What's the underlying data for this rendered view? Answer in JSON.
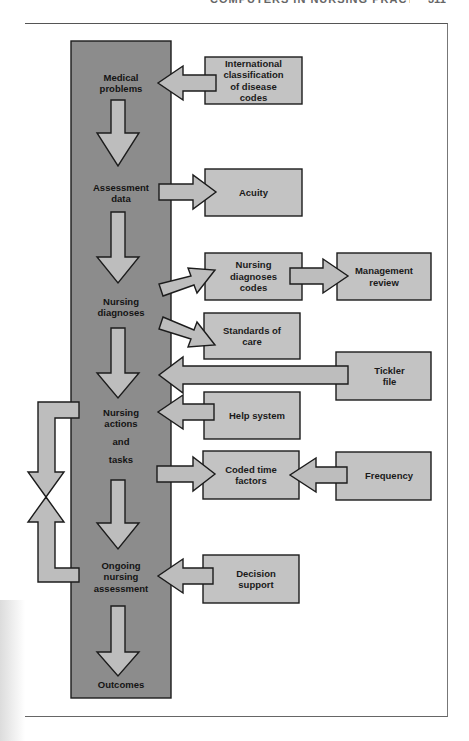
{
  "page": {
    "running_head": "COMPUTERS IN NURSING PRACTICE",
    "page_number": "311"
  },
  "colors": {
    "main_column": "#8c8c8c",
    "box_fill": "#c3c3c3",
    "arrow_fill": "#bdbdbd",
    "outline": "#1c1c1c",
    "background": "#ffffff"
  },
  "main_column": {
    "stages": [
      {
        "id": "medical-problems",
        "label": "Medical\nproblems"
      },
      {
        "id": "assessment-data",
        "label": "Assessment\ndata"
      },
      {
        "id": "nursing-diagnoses",
        "label": "Nursing\ndiagnoses"
      },
      {
        "id": "nursing-actions",
        "label": "Nursing\nactions"
      },
      {
        "id": "and",
        "label": "and"
      },
      {
        "id": "tasks",
        "label": "tasks"
      },
      {
        "id": "ongoing-assessment",
        "label": "Ongoing\nnursing\nassessment"
      },
      {
        "id": "outcomes",
        "label": "Outcomes"
      }
    ]
  },
  "boxes": [
    {
      "id": "icd",
      "label": "International\nclassification\nof disease\ncodes",
      "connects_to": "medical-problems",
      "direction": "into-column"
    },
    {
      "id": "acuity",
      "label": "Acuity",
      "connects_from": "assessment-data",
      "direction": "out-of-column"
    },
    {
      "id": "nursing-diagnoses-codes",
      "label": "Nursing\ndiagnoses\ncodes",
      "connects_from": "nursing-diagnoses",
      "direction": "out-of-column"
    },
    {
      "id": "management-review",
      "label": "Management\nreview",
      "connects_from": "nursing-diagnoses-codes",
      "direction": "right"
    },
    {
      "id": "standards-of-care",
      "label": "Standards of\ncare",
      "connects_from": "nursing-diagnoses",
      "direction": "out-of-column"
    },
    {
      "id": "tickler-file",
      "label": "Tickler\nfile",
      "connects_to": "nursing-actions",
      "direction": "into-column"
    },
    {
      "id": "help-system",
      "label": "Help system",
      "connects_to": "nursing-actions",
      "direction": "into-column"
    },
    {
      "id": "coded-time-factors",
      "label": "Coded time\nfactors",
      "connects_from": "tasks",
      "direction": "out-of-column"
    },
    {
      "id": "frequency",
      "label": "Frequency",
      "connects_to": "coded-time-factors",
      "direction": "left"
    },
    {
      "id": "decision-support",
      "label": "Decision\nsupport",
      "connects_to": "ongoing-assessment",
      "direction": "into-column"
    }
  ],
  "feedback_loop": {
    "between": [
      "nursing-actions",
      "ongoing-assessment"
    ],
    "description": "bidirectional loop arrows on left side of column"
  }
}
